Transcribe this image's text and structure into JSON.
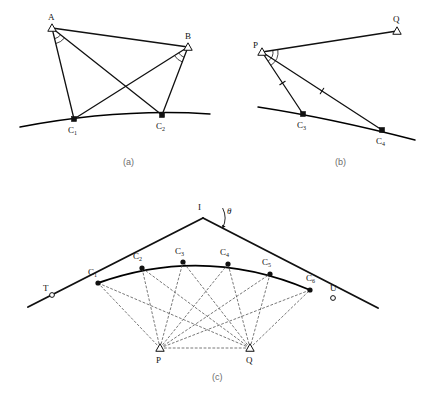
{
  "figure": {
    "title_visible": false,
    "colors": {
      "ink": "#111111",
      "curve": "#000000",
      "dashed": "#555555",
      "caption": "#6b6b6b",
      "background": "#ffffff"
    },
    "panels": [
      {
        "id": "a",
        "caption": "(a)",
        "caption_pos": {
          "x": 123,
          "y": 165
        },
        "description": "Two stations A and B sighting two curve points C1 and C2",
        "stations": [
          {
            "name": "A",
            "label": "A",
            "marker": "triangle-open",
            "x": 52,
            "y": 28,
            "label_x": 48,
            "label_y": 20
          },
          {
            "name": "B",
            "label": "B",
            "marker": "triangle-open",
            "x": 188,
            "y": 47,
            "label_x": 185,
            "label_y": 39
          }
        ],
        "curve_points": [
          {
            "name": "C1",
            "label": "C",
            "sub": "1",
            "marker": "square-filled",
            "x": 74,
            "y": 119,
            "label_x": 68,
            "label_y": 133
          },
          {
            "name": "C2",
            "label": "C",
            "sub": "2",
            "marker": "square-filled",
            "x": 162,
            "y": 115,
            "label_x": 156,
            "label_y": 129
          }
        ],
        "sight_lines": [
          {
            "from": "A",
            "to": "C1"
          },
          {
            "from": "A",
            "to": "C2"
          },
          {
            "from": "B",
            "to": "C1"
          },
          {
            "from": "B",
            "to": "C2"
          },
          {
            "from": "A",
            "to": "B"
          }
        ],
        "angle_arcs": [
          {
            "at": "A",
            "count": 2
          },
          {
            "at": "B",
            "count": 2
          }
        ],
        "curve": {
          "x1": 20,
          "y1": 127,
          "cx": 120,
          "cy": 108,
          "x2": 210,
          "y2": 114
        }
      },
      {
        "id": "b",
        "caption": "(b)",
        "caption_pos": {
          "x": 335,
          "y": 165
        },
        "description": "Station P sighting curve points C3 and C4, with Q reference",
        "stations": [
          {
            "name": "P",
            "label": "P",
            "marker": "triangle-open",
            "x": 262,
            "y": 52,
            "label_x": 253,
            "label_y": 48
          },
          {
            "name": "Q",
            "label": "Q",
            "marker": "triangle-open",
            "x": 397,
            "y": 31,
            "label_x": 393,
            "label_y": 22
          }
        ],
        "curve_points": [
          {
            "name": "C3",
            "label": "C",
            "sub": "3",
            "marker": "square-filled",
            "x": 303,
            "y": 114,
            "label_x": 297,
            "label_y": 128
          },
          {
            "name": "C4",
            "label": "C",
            "sub": "4",
            "marker": "square-filled",
            "x": 382,
            "y": 130,
            "label_x": 376,
            "label_y": 144
          }
        ],
        "sight_lines": [
          {
            "from": "P",
            "to": "Q"
          },
          {
            "from": "P",
            "to": "C3",
            "tick": true
          },
          {
            "from": "P",
            "to": "C4",
            "tick": true
          }
        ],
        "angle_arcs": [
          {
            "at": "P",
            "count": 2
          }
        ],
        "curve": {
          "x1": 258,
          "y1": 107,
          "cx": 330,
          "cy": 118,
          "x2": 415,
          "y2": 140
        }
      },
      {
        "id": "c",
        "caption": "(c)",
        "caption_pos": {
          "x": 212,
          "y": 380
        },
        "description": "Circular curve with six points C1..C6, tangents through I at deflection angle theta, observed from baseline stations P and Q; tangent points T and U",
        "intersection_point": {
          "name": "I",
          "label": "I",
          "x": 203,
          "y": 218,
          "label_x": 198,
          "label_y": 210
        },
        "angle_label": "θ",
        "angle_label_pos": {
          "x": 227,
          "y": 214
        },
        "tangent_markers": [
          {
            "name": "T",
            "label": "T",
            "marker": "circle-open",
            "x": 52,
            "y": 295,
            "label_x": 43,
            "label_y": 291
          },
          {
            "name": "U",
            "label": "U",
            "marker": "circle-open",
            "x": 333,
            "y": 298,
            "label_x": 330,
            "label_y": 291
          }
        ],
        "stations": [
          {
            "name": "P",
            "label": "P",
            "marker": "triangle-open",
            "x": 160,
            "y": 348,
            "label_x": 156,
            "label_y": 363
          },
          {
            "name": "Q",
            "label": "Q",
            "marker": "triangle-open",
            "x": 250,
            "y": 348,
            "label_x": 246,
            "label_y": 363
          }
        ],
        "curve_points": [
          {
            "name": "C1",
            "label": "C",
            "sub": "1",
            "marker": "dot-filled",
            "x": 98,
            "y": 283,
            "label_x": 88,
            "label_y": 275
          },
          {
            "name": "C2",
            "label": "C",
            "sub": "2",
            "marker": "dot-filled",
            "x": 142,
            "y": 268,
            "label_x": 133,
            "label_y": 259
          },
          {
            "name": "C3",
            "label": "C",
            "sub": "3",
            "marker": "dot-filled",
            "x": 183,
            "y": 262,
            "label_x": 175,
            "label_y": 254
          },
          {
            "name": "C4",
            "label": "C",
            "sub": "4",
            "marker": "dot-filled",
            "x": 228,
            "y": 264,
            "label_x": 220,
            "label_y": 255
          },
          {
            "name": "C5",
            "label": "C",
            "sub": "5",
            "marker": "dot-filled",
            "x": 270,
            "y": 274,
            "label_x": 262,
            "label_y": 265
          },
          {
            "name": "C6",
            "label": "C",
            "sub": "6",
            "marker": "dot-filled",
            "x": 310,
            "y": 290,
            "label_x": 306,
            "label_y": 281
          }
        ],
        "tangent_back": {
          "x1": 28,
          "y1": 307,
          "x2": 203,
          "y2": 218
        },
        "tangent_forward": {
          "x1": 203,
          "y1": 218,
          "x2": 378,
          "y2": 308
        },
        "curve": {
          "x1": 98,
          "y1": 283,
          "cx": 205,
          "cy": 245,
          "x2": 310,
          "y2": 290
        },
        "observation_rays": [
          {
            "from": "P",
            "to": "C1"
          },
          {
            "from": "P",
            "to": "C2"
          },
          {
            "from": "P",
            "to": "C3"
          },
          {
            "from": "P",
            "to": "C4"
          },
          {
            "from": "P",
            "to": "C5"
          },
          {
            "from": "P",
            "to": "C6"
          },
          {
            "from": "Q",
            "to": "C1"
          },
          {
            "from": "Q",
            "to": "C2"
          },
          {
            "from": "Q",
            "to": "C3"
          },
          {
            "from": "Q",
            "to": "C4"
          },
          {
            "from": "Q",
            "to": "C5"
          },
          {
            "from": "Q",
            "to": "C6"
          },
          {
            "from": "P",
            "to": "Q"
          }
        ]
      }
    ]
  }
}
